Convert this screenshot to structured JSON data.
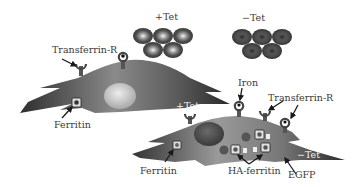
{
  "figure": {
    "rbc_groups": [
      {
        "label": "+Tet",
        "cell_count": 5,
        "cell_style": "light-center"
      },
      {
        "label": "−Tet",
        "cell_count": 5,
        "cell_style": "dark-center"
      }
    ],
    "cell_top": {
      "condition_label": "+Tet",
      "labels": {
        "receptor": "Transferrin-R",
        "ferritin": "Ferritin"
      }
    },
    "cell_bottom": {
      "condition_label": "−Tet",
      "labels": {
        "iron": "Iron",
        "receptor": "Transferrin-R",
        "ferritin": "Ferritin",
        "ha_ferritin": "HA-ferritin",
        "egfp": "EGFP"
      }
    },
    "colors": {
      "cell_dark": "#3d3d3d",
      "cell_mid": "#7a7a7a",
      "nucleus_light": "#d9d9d9",
      "nucleus_dark": "#4a4a4a",
      "rbc_outer": "#4f4f4f",
      "text": "#3a3a3a"
    }
  }
}
